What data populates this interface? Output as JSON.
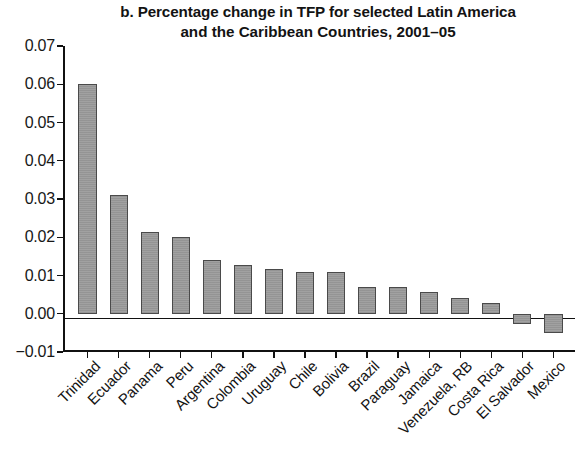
{
  "title": {
    "line1": "b. Percentage change in TFP for selected Latin America",
    "line2": "and the Caribbean Countries, 2001–05"
  },
  "axis": {
    "y_tick_labels": [
      "0.07",
      "0.06",
      "0.05",
      "0.04",
      "0.03",
      "0.02",
      "0.01",
      "0.00",
      "−0.01"
    ]
  },
  "colors": {
    "bar_fill": "#9c9c9c",
    "bar_stroke": "#4a4a4a",
    "axis": "#111111",
    "text": "#141414"
  },
  "chart_data": {
    "type": "bar",
    "title": "b. Percentage change in TFP for selected Latin America and the Caribbean Countries, 2001–05",
    "xlabel": "",
    "ylabel": "",
    "ylim": [
      -0.01,
      0.07
    ],
    "ytick_step": 0.01,
    "yticks": [
      -0.01,
      0.0,
      0.01,
      0.02,
      0.03,
      0.04,
      0.05,
      0.06,
      0.07
    ],
    "grid": false,
    "legend": false,
    "categories": [
      "Trinidad",
      "Ecuador",
      "Panama",
      "Peru",
      "Argentina",
      "Colombia",
      "Uruguay",
      "Chile",
      "Bolivia",
      "Brazil",
      "Paraguay",
      "Jamaica",
      "Venezuela, RB",
      "Costa Rica",
      "El Salvador",
      "Mexico"
    ],
    "values": [
      0.06,
      0.031,
      0.0215,
      0.02,
      0.014,
      0.0128,
      0.0118,
      0.011,
      0.0108,
      0.007,
      0.0069,
      0.0058,
      0.004,
      0.0028,
      -0.0028,
      -0.005
    ]
  }
}
